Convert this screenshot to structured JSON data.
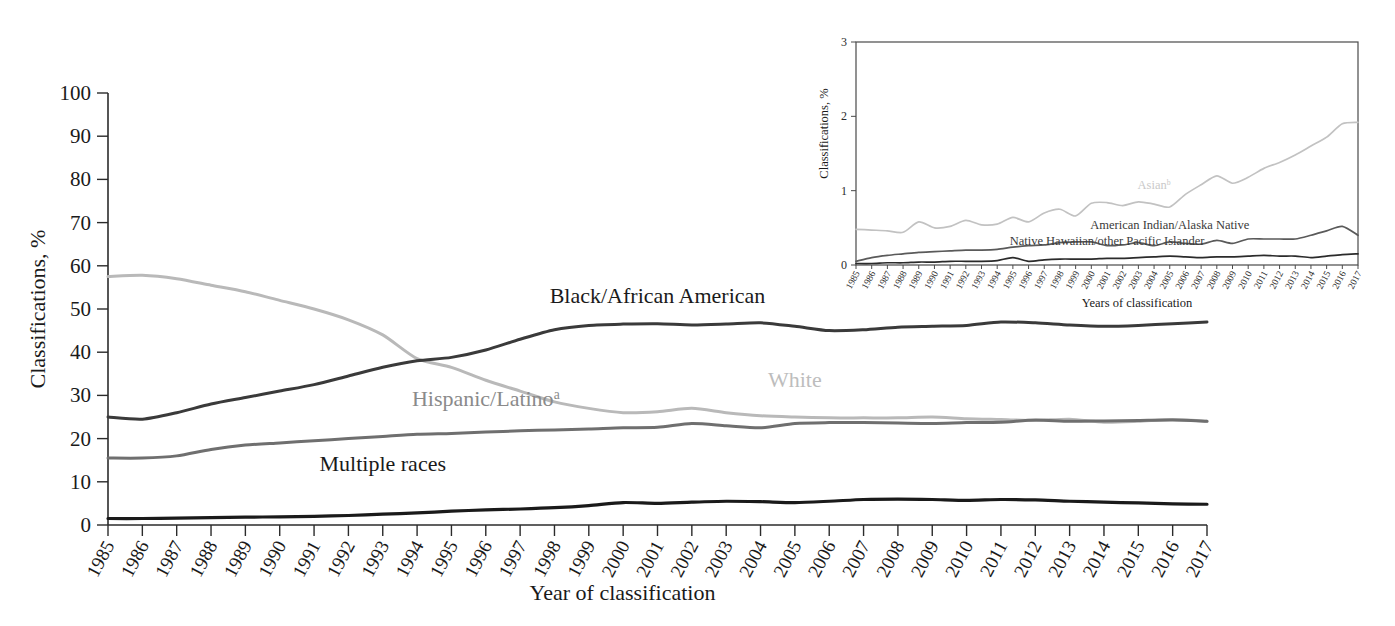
{
  "chart_data": [
    {
      "id": "main",
      "type": "line",
      "title": "",
      "xlabel": "Year of classification",
      "ylabel": "Classifications, %",
      "ylim": [
        0,
        100
      ],
      "ytickstep": 10,
      "yticks": [
        "0",
        "10",
        "20",
        "30",
        "40",
        "50",
        "60",
        "70",
        "80",
        "90",
        "100"
      ],
      "grid": false,
      "legend_position": "inline-annotations",
      "x": [
        1985,
        1986,
        1987,
        1988,
        1989,
        1990,
        1991,
        1992,
        1993,
        1994,
        1995,
        1996,
        1997,
        1998,
        1999,
        2000,
        2001,
        2002,
        2003,
        2004,
        2005,
        2006,
        2007,
        2008,
        2009,
        2010,
        2011,
        2012,
        2013,
        2014,
        2015,
        2016,
        2017
      ],
      "categories": [
        "1985",
        "1986",
        "1987",
        "1988",
        "1989",
        "1990",
        "1991",
        "1992",
        "1993",
        "1994",
        "1995",
        "1996",
        "1997",
        "1998",
        "1999",
        "2000",
        "2001",
        "2002",
        "2003",
        "2004",
        "2005",
        "2006",
        "2007",
        "2008",
        "2009",
        "2010",
        "2011",
        "2012",
        "2013",
        "2014",
        "2015",
        "2016",
        "2017"
      ],
      "series": [
        {
          "name": "White",
          "label": "White",
          "color": "#b9b9b9",
          "label_x": 2005,
          "label_y": 32.0,
          "values": [
            57.5,
            57.8,
            57.0,
            55.5,
            54.0,
            52.0,
            50.0,
            47.5,
            44.0,
            38.5,
            36.5,
            33.5,
            31.0,
            28.5,
            27.0,
            26.0,
            26.2,
            27.0,
            26.0,
            25.3,
            25.0,
            24.8,
            24.8,
            24.8,
            25.0,
            24.6,
            24.4,
            24.2,
            24.5,
            23.8,
            24.0,
            24.4,
            24.0
          ]
        },
        {
          "name": "Black/African American",
          "label": "Black/African American",
          "color": "#3a3a3a",
          "label_x": 2001,
          "label_y": 51.5,
          "values": [
            25.0,
            24.5,
            26.0,
            28.0,
            29.5,
            31.0,
            32.5,
            34.5,
            36.5,
            38.0,
            38.8,
            40.5,
            43.0,
            45.2,
            46.2,
            46.5,
            46.6,
            46.3,
            46.5,
            46.8,
            46.0,
            45.0,
            45.2,
            45.8,
            46.0,
            46.2,
            47.0,
            46.8,
            46.3,
            46.0,
            46.2,
            46.6,
            47.0
          ]
        },
        {
          "name": "Hispanic/Latino",
          "label": "Hispanic/Latinoᵃ",
          "color": "#6f6f6f",
          "label_x": 1996,
          "label_y": 27.5,
          "values": [
            15.5,
            15.5,
            16.0,
            17.5,
            18.5,
            19.0,
            19.5,
            20.0,
            20.5,
            21.0,
            21.2,
            21.5,
            21.8,
            22.0,
            22.2,
            22.5,
            22.6,
            23.5,
            23.0,
            22.5,
            23.5,
            23.7,
            23.7,
            23.6,
            23.5,
            23.7,
            23.8,
            24.3,
            24.0,
            24.1,
            24.2,
            24.3,
            24.0
          ]
        },
        {
          "name": "Multiple races",
          "label": "Multiple races",
          "color": "#1a1a1a",
          "label_x": 1993,
          "label_y": 12.5,
          "values": [
            1.5,
            1.5,
            1.6,
            1.7,
            1.8,
            1.9,
            2.0,
            2.2,
            2.5,
            2.8,
            3.2,
            3.5,
            3.7,
            4.0,
            4.5,
            5.2,
            5.0,
            5.3,
            5.5,
            5.4,
            5.2,
            5.5,
            5.9,
            6.0,
            5.9,
            5.7,
            5.9,
            5.8,
            5.5,
            5.3,
            5.1,
            4.9,
            4.8
          ]
        }
      ]
    },
    {
      "id": "inset",
      "type": "line",
      "title": "",
      "xlabel": "Years of classification",
      "ylabel": "Classifications, %",
      "ylim": [
        0,
        3
      ],
      "yticks": [
        "0",
        "1",
        "2",
        "3"
      ],
      "grid": false,
      "legend_position": "inline-annotations",
      "categories": [
        "1985",
        "1986",
        "1987",
        "1988",
        "1989",
        "1990",
        "1991",
        "1992",
        "1993",
        "1994",
        "1995",
        "1996",
        "1997",
        "1998",
        "1999",
        "2000",
        "2001",
        "2002",
        "2003",
        "2004",
        "2005",
        "2006",
        "2007",
        "2008",
        "2009",
        "2010",
        "2011",
        "2012",
        "2013",
        "2014",
        "2015",
        "2016",
        "2017"
      ],
      "series": [
        {
          "name": "Asian",
          "label": "Asianᵇ",
          "color": "#c2c2c2",
          "label_x": 2004,
          "label_y": 1.02,
          "values": [
            0.48,
            0.47,
            0.46,
            0.44,
            0.58,
            0.5,
            0.52,
            0.6,
            0.54,
            0.55,
            0.64,
            0.58,
            0.7,
            0.75,
            0.66,
            0.83,
            0.84,
            0.8,
            0.85,
            0.82,
            0.78,
            0.95,
            1.08,
            1.2,
            1.1,
            1.18,
            1.3,
            1.38,
            1.48,
            1.6,
            1.72,
            1.9,
            1.92
          ]
        },
        {
          "name": "American Indian/Alaska Native",
          "label": "American Indian/Alaska Native",
          "color": "#5a5a5a",
          "label_x": 2005,
          "label_y": 0.48,
          "values": [
            0.05,
            0.1,
            0.13,
            0.15,
            0.17,
            0.18,
            0.19,
            0.2,
            0.2,
            0.21,
            0.24,
            0.26,
            0.27,
            0.3,
            0.31,
            0.31,
            0.26,
            0.27,
            0.3,
            0.26,
            0.31,
            0.29,
            0.28,
            0.33,
            0.29,
            0.35,
            0.35,
            0.35,
            0.35,
            0.4,
            0.46,
            0.52,
            0.4
          ]
        },
        {
          "name": "Native Hawaiian/other Pacific Islander",
          "label": "Native Hawaiian/other Pacific Islander",
          "color": "#2b2b2b",
          "label_x": 2001,
          "label_y": 0.27,
          "values": [
            0.02,
            0.02,
            0.03,
            0.03,
            0.04,
            0.04,
            0.05,
            0.05,
            0.05,
            0.06,
            0.1,
            0.05,
            0.07,
            0.08,
            0.08,
            0.08,
            0.09,
            0.09,
            0.1,
            0.11,
            0.12,
            0.11,
            0.1,
            0.11,
            0.11,
            0.12,
            0.13,
            0.12,
            0.12,
            0.1,
            0.12,
            0.14,
            0.15
          ]
        }
      ]
    }
  ]
}
